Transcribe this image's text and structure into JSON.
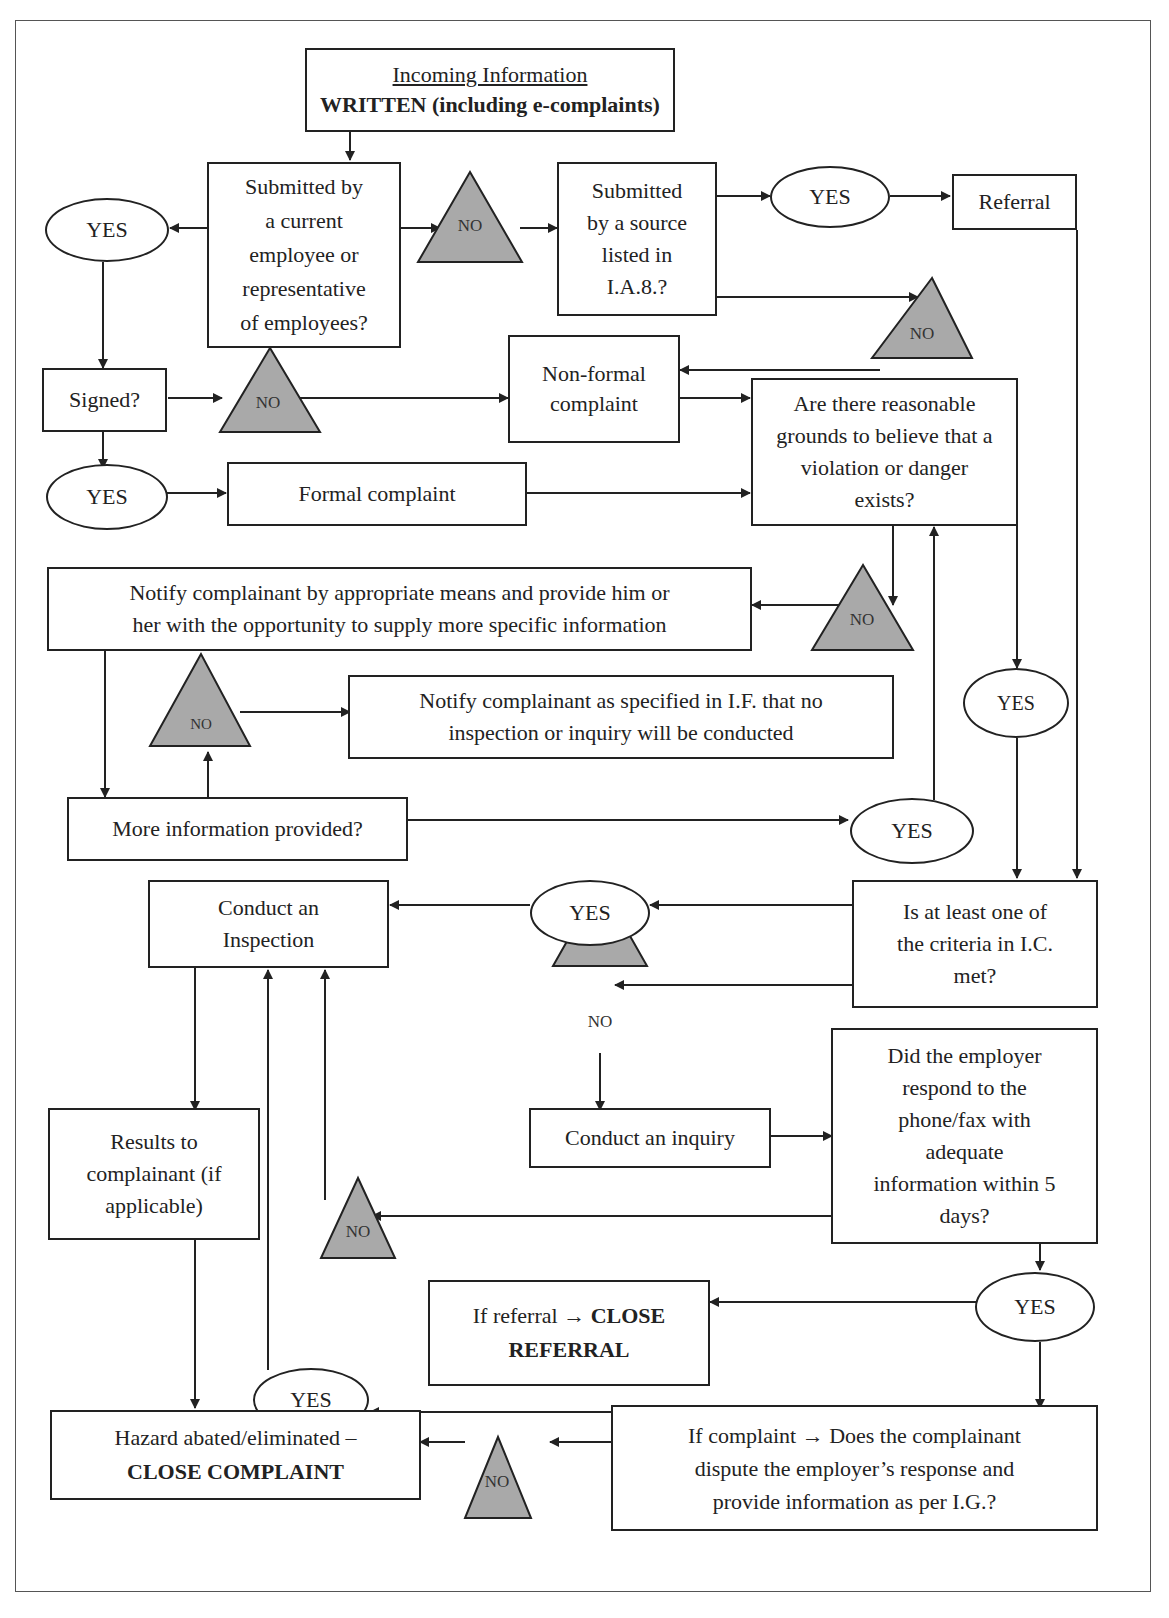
{
  "diagram": {
    "title_box": {
      "line1": "Incoming Information",
      "line2": "WRITTEN (including e-complaints)"
    },
    "nodes": {
      "submitted_employee": [
        "Submitted by",
        "a current",
        "employee or",
        "representative",
        "of employees?"
      ],
      "submitted_source": [
        "Submitted",
        "by a source",
        "listed in",
        "I.A.8.?"
      ],
      "referral": "Referral",
      "signed": "Signed?",
      "non_formal": [
        "Non-formal",
        "complaint"
      ],
      "formal": "Formal complaint",
      "reasonable_grounds": [
        "Are there reasonable",
        "grounds to believe that a",
        "violation or danger",
        "exists?"
      ],
      "notify_more_info": [
        "Notify complainant by appropriate means and provide him or",
        "her with the opportunity to supply more specific information"
      ],
      "notify_no_inspection": [
        "Notify complainant as specified in I.F. that no",
        "inspection or inquiry will be conducted"
      ],
      "more_info": "More information provided?",
      "conduct_inspection": [
        "Conduct an",
        "Inspection"
      ],
      "criteria_met": [
        "Is at least one of",
        "the criteria in I.C.",
        "met?"
      ],
      "conduct_inquiry": "Conduct an inquiry",
      "employer_respond": [
        "Did the employer",
        "respond to the",
        "phone/fax with",
        "adequate",
        "information within 5",
        "days?"
      ],
      "results": [
        "Results to",
        "complainant (if",
        "applicable)"
      ],
      "close_referral": {
        "pre": "If referral → ",
        "bold1": "CLOSE",
        "bold2": "REFERRAL"
      },
      "close_complaint": {
        "line1": "Hazard abated/eliminated –",
        "line2": "CLOSE COMPLAINT"
      },
      "dispute": [
        "If complaint → Does the complainant",
        "dispute the employer’s response and",
        "provide information as per I.G.?"
      ]
    },
    "yes_label": "YES",
    "no_label": "NO",
    "colors": {
      "triangle_fill": "#a9a9a9",
      "stroke": "#222222"
    }
  }
}
